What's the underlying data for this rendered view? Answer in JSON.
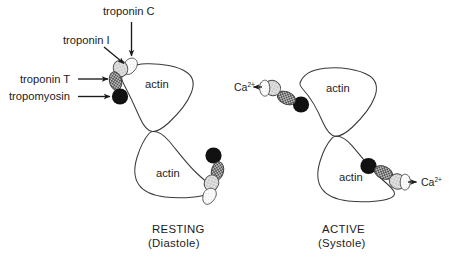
{
  "figure": {
    "background_color": "#ffffff",
    "text_color": "#1b1b1b",
    "outline_color": "#3a3a3a"
  },
  "labels": {
    "troponin_c": "troponin C",
    "troponin_i": "troponin I",
    "troponin_t": "troponin T",
    "tropomyosin": "tropomyosin",
    "actin": "actin"
  },
  "panels": {
    "left": {
      "caption_main": "RESTING",
      "caption_sub": "(Diastole)",
      "actin_top_label": "actin",
      "actin_bottom_label": "actin"
    },
    "right": {
      "caption_main": "ACTIVE",
      "caption_sub": "(Systole)",
      "actin_top_label": "actin",
      "actin_bottom_label": "actin",
      "calcium_left": "Ca",
      "calcium_left_charge": "2+",
      "calcium_right": "Ca",
      "calcium_right_charge": "2+"
    }
  },
  "legend_colors": {
    "tropomyosin_fill": "#111111",
    "troponin_t_fill": "#8d8d8d",
    "troponin_c_fill": "#d8d8d8",
    "troponin_i_fill": "#fbfbfb",
    "actin_outline": "#3a3a3a"
  },
  "icons": {
    "arrow": "arrow-icon",
    "calcium_arrow": "calcium-arrow-icon"
  }
}
